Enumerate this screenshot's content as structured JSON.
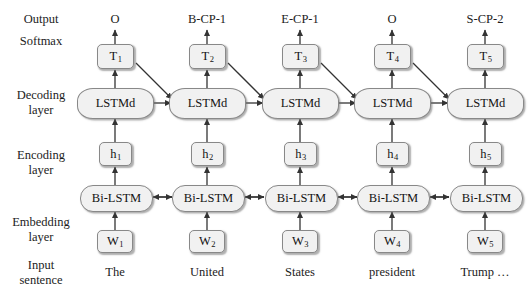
{
  "figure": {
    "type": "neural-network-architecture-diagram",
    "background": "#ffffff",
    "node_fill": "#f1f1f1",
    "node_stroke": "#888888"
  },
  "row_labels": [
    {
      "id": "output",
      "line1": "Output",
      "line2": ""
    },
    {
      "id": "softmax",
      "line1": "Softmax",
      "line2": ""
    },
    {
      "id": "decoding",
      "line1": "Decoding",
      "line2": "layer"
    },
    {
      "id": "encoding",
      "line1": "Encoding",
      "line2": "layer"
    },
    {
      "id": "embedding",
      "line1": "Embedding",
      "line2": "layer"
    },
    {
      "id": "input",
      "line1": "Input",
      "line2": "sentence"
    }
  ],
  "columns": [
    {
      "index": 1,
      "output_tag": "O",
      "softmax": "T",
      "softmax_sub": "1",
      "decoder": "LSTMd",
      "hidden": "h",
      "hidden_sub": "1",
      "encoder": "Bi-LSTM",
      "embedding": "W",
      "embedding_sub": "1",
      "word": "The"
    },
    {
      "index": 2,
      "output_tag": "B-CP-1",
      "softmax": "T",
      "softmax_sub": "2",
      "decoder": "LSTMd",
      "hidden": "h",
      "hidden_sub": "2",
      "encoder": "Bi-LSTM",
      "embedding": "W",
      "embedding_sub": "2",
      "word": "United"
    },
    {
      "index": 3,
      "output_tag": "E-CP-1",
      "softmax": "T",
      "softmax_sub": "3",
      "decoder": "LSTMd",
      "hidden": "h",
      "hidden_sub": "3",
      "encoder": "Bi-LSTM",
      "embedding": "W",
      "embedding_sub": "3",
      "word": "States"
    },
    {
      "index": 4,
      "output_tag": "O",
      "softmax": "T",
      "softmax_sub": "4",
      "decoder": "LSTMd",
      "hidden": "h",
      "hidden_sub": "4",
      "encoder": "Bi-LSTM",
      "embedding": "W",
      "embedding_sub": "4",
      "word": "president"
    },
    {
      "index": 5,
      "output_tag": "S-CP-2",
      "softmax": "T",
      "softmax_sub": "5",
      "decoder": "LSTMd",
      "hidden": "h",
      "hidden_sub": "5",
      "encoder": "Bi-LSTM",
      "embedding": "W",
      "embedding_sub": "5",
      "word": "Trump …"
    }
  ]
}
